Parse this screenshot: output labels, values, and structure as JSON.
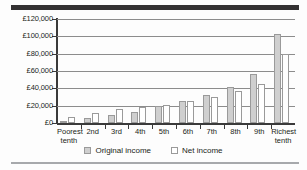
{
  "chart_data": {
    "type": "bar",
    "title": "",
    "xlabel": "",
    "ylabel": "",
    "ylim": [
      0,
      120000
    ],
    "ytick_values": [
      0,
      20000,
      40000,
      60000,
      80000,
      100000,
      120000
    ],
    "ytick_labels": [
      "£0",
      "£20,000",
      "£40,000",
      "£60,000",
      "£80,000",
      "£100,000",
      "£120,000"
    ],
    "grid": true,
    "legend_position": "bottom",
    "currency_symbol": "£",
    "categories": [
      "Poorest tenth",
      "2nd",
      "3rd",
      "4th",
      "5th",
      "6th",
      "7th",
      "8th",
      "9th",
      "Richest tenth"
    ],
    "category_lines": [
      [
        "Poorest",
        "tenth"
      ],
      [
        "2nd"
      ],
      [
        "3rd"
      ],
      [
        "4th"
      ],
      [
        "5th"
      ],
      [
        "6th"
      ],
      [
        "7th"
      ],
      [
        "8th"
      ],
      [
        "9th"
      ],
      [
        "Richest",
        "tenth"
      ]
    ],
    "series": [
      {
        "name": "Original income",
        "color": "#cfcfcf",
        "values": [
          2500,
          5500,
          9000,
          13000,
          19500,
          25500,
          32000,
          41000,
          56000,
          103000
        ]
      },
      {
        "name": "Net income",
        "color": "#ffffff",
        "values": [
          7000,
          11500,
          16000,
          18500,
          21000,
          25500,
          30500,
          37000,
          45500,
          80000
        ]
      }
    ]
  },
  "legend": {
    "items": [
      {
        "label": "Original income",
        "swatch": "original"
      },
      {
        "label": "Net income",
        "swatch": "net"
      }
    ]
  },
  "colors": {
    "top_rule": "#333132",
    "bottom_rule": "#a7a9ac",
    "axis": "#3a3a3a",
    "gridline": "#8c8c8c",
    "bar_original": "#cfcfcf",
    "bar_net": "#ffffff",
    "bar_border": "#9a9a9a",
    "text": "#231f20"
  }
}
